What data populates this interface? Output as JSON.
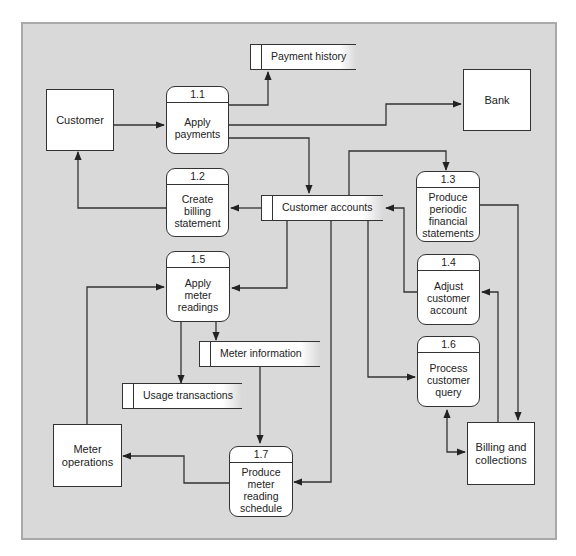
{
  "diagram": {
    "type": "data-flow-diagram",
    "colors": {
      "background": "#d9d9d9",
      "box_fill": "#ffffff",
      "line": "#333333"
    },
    "external_entities": [
      {
        "id": "customer",
        "label": "Customer"
      },
      {
        "id": "bank",
        "label": "Bank"
      },
      {
        "id": "meter_operations",
        "label": "Meter operations"
      },
      {
        "id": "billing_collections",
        "label": "Billing and collections"
      }
    ],
    "processes": [
      {
        "id": "1.1",
        "label": "Apply payments"
      },
      {
        "id": "1.2",
        "label": "Create billing statement"
      },
      {
        "id": "1.3",
        "label": "Produce periodic financial statements"
      },
      {
        "id": "1.4",
        "label": "Adjust customer account"
      },
      {
        "id": "1.5",
        "label": "Apply meter readings"
      },
      {
        "id": "1.6",
        "label": "Process customer query"
      },
      {
        "id": "1.7",
        "label": "Produce meter reading schedule"
      }
    ],
    "data_stores": [
      {
        "id": "payment_history",
        "label": "Payment history"
      },
      {
        "id": "customer_accounts",
        "label": "Customer accounts"
      },
      {
        "id": "meter_information",
        "label": "Meter information"
      },
      {
        "id": "usage_transactions",
        "label": "Usage transactions"
      }
    ],
    "flows": [
      {
        "from": "Customer",
        "to": "1.1"
      },
      {
        "from": "1.1",
        "to": "Payment history"
      },
      {
        "from": "1.1",
        "to": "Bank"
      },
      {
        "from": "1.1",
        "to": "Customer accounts"
      },
      {
        "from": "Customer accounts",
        "to": "1.2"
      },
      {
        "from": "1.2",
        "to": "Customer"
      },
      {
        "from": "Customer accounts",
        "to": "1.3"
      },
      {
        "from": "1.3",
        "to": "Billing and collections"
      },
      {
        "from": "1.4",
        "to": "Customer accounts"
      },
      {
        "from": "Billing and collections",
        "to": "1.4"
      },
      {
        "from": "Customer accounts",
        "to": "1.5"
      },
      {
        "from": "Meter operations",
        "to": "1.5"
      },
      {
        "from": "1.5",
        "to": "Meter information"
      },
      {
        "from": "1.5",
        "to": "Usage transactions"
      },
      {
        "from": "Customer accounts",
        "to": "1.6"
      },
      {
        "from": "1.6",
        "to": "Billing and collections",
        "bidirectional": true
      },
      {
        "from": "Meter information",
        "to": "1.7"
      },
      {
        "from": "Customer accounts",
        "to": "1.7"
      },
      {
        "from": "1.7",
        "to": "Meter operations"
      }
    ]
  },
  "labels": {
    "customer": "Customer",
    "bank": "Bank",
    "meter_ops_1": "Meter",
    "meter_ops_2": "operations",
    "billing_1": "Billing and",
    "billing_2": "collections",
    "p11_id": "1.1",
    "p11_1": "Apply",
    "p11_2": "payments",
    "p12_id": "1.2",
    "p12_1": "Create",
    "p12_2": "billing",
    "p12_3": "statement",
    "p13_id": "1.3",
    "p13_1": "Produce",
    "p13_2": "periodic",
    "p13_3": "financial",
    "p13_4": "statements",
    "p14_id": "1.4",
    "p14_1": "Adjust",
    "p14_2": "customer",
    "p14_3": "account",
    "p15_id": "1.5",
    "p15_1": "Apply",
    "p15_2": "meter",
    "p15_3": "readings",
    "p16_id": "1.6",
    "p16_1": "Process",
    "p16_2": "customer",
    "p16_3": "query",
    "p17_id": "1.7",
    "p17_1": "Produce",
    "p17_2": "meter",
    "p17_3": "reading",
    "p17_4": "schedule",
    "ds_payment_history": "Payment history",
    "ds_customer_accounts": "Customer accounts",
    "ds_meter_information": "Meter information",
    "ds_usage_transactions": "Usage transactions"
  }
}
